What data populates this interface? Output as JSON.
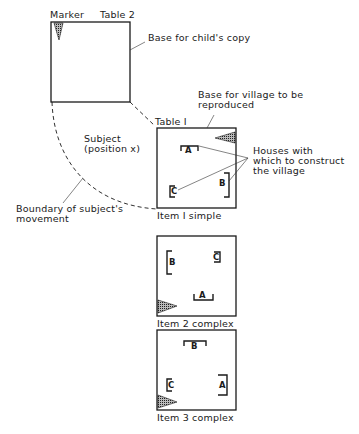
{
  "labels": {
    "marker": "Marker",
    "table2": "Table 2",
    "base_child_copy": "Base for child's copy",
    "base_village": "Base for village to be\nreproduced",
    "table1": "Table I",
    "subject": "Subject\n(position x)",
    "houses": "Houses with\nwhich to construct\nthe village",
    "boundary": "Boundary of subject's\nmovement"
  },
  "items": [
    {
      "caption": "Item I simple",
      "houses": [
        "A",
        "B",
        "C"
      ]
    },
    {
      "caption": "Item 2 complex",
      "houses": [
        "B",
        "C",
        "A"
      ]
    },
    {
      "caption": "Item 3 complex",
      "houses": [
        "B",
        "C",
        "A"
      ]
    }
  ],
  "colors": {
    "line": "#1a1a1a",
    "marker_fill": "#777777"
  }
}
